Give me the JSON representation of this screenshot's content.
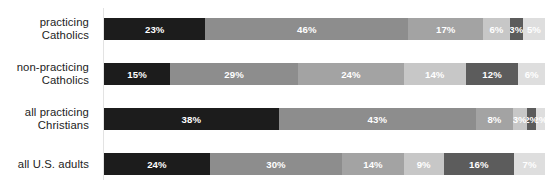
{
  "chart": {
    "type": "bar",
    "orientation": "horizontal-stacked",
    "background_color": "#ffffff",
    "axis_line_color": "#e3e3e3",
    "label_color": "#232323"
  },
  "chart_data": {
    "type": "bar",
    "title": "",
    "subtitle": "",
    "xlabel": "",
    "ylabel": "",
    "grid": false,
    "legend": null,
    "stacked": true,
    "orientation": "horizontal",
    "xlim": [
      0,
      100
    ],
    "categories": [
      "practicing\nCatholics",
      "non-practicing\nCatholics",
      "all practicing\nChristians",
      "all U.S. adults"
    ],
    "series": [
      {
        "name": "segment-1",
        "color": "#1c1c1c",
        "text_color": "#ffffff",
        "values": [
          23,
          15,
          38,
          24
        ]
      },
      {
        "name": "segment-2",
        "color": "#8d8d8d",
        "text_color": "#ffffff",
        "values": [
          46,
          29,
          43,
          30
        ]
      },
      {
        "name": "segment-3",
        "color": "#a3a3a3",
        "text_color": "#ffffff",
        "values": [
          17,
          24,
          8,
          14
        ]
      },
      {
        "name": "segment-4",
        "color": "#c7c7c7",
        "text_color": "#ffffff",
        "values": [
          6,
          14,
          3,
          9
        ]
      },
      {
        "name": "segment-5",
        "color": "#5c5c5c",
        "text_color": "#ffffff",
        "values": [
          3,
          12,
          2,
          16
        ]
      },
      {
        "name": "segment-6",
        "color": "#dedede",
        "text_color": "#ffffff",
        "values": [
          5,
          6,
          2,
          7
        ]
      }
    ]
  },
  "rows": [
    {
      "label": "practicing\nCatholics",
      "segments": [
        {
          "value": 23,
          "label": "23%",
          "color": "#1c1c1c",
          "text_color": "#ffffff"
        },
        {
          "value": 46,
          "label": "46%",
          "color": "#8d8d8d",
          "text_color": "#ffffff"
        },
        {
          "value": 17,
          "label": "17%",
          "color": "#a3a3a3",
          "text_color": "#ffffff"
        },
        {
          "value": 6,
          "label": "6%",
          "color": "#c7c7c7",
          "text_color": "#ffffff"
        },
        {
          "value": 3,
          "label": "3%",
          "color": "#5c5c5c",
          "text_color": "#ffffff"
        },
        {
          "value": 5,
          "label": "5%",
          "color": "#dedede",
          "text_color": "#ffffff"
        }
      ]
    },
    {
      "label": "non-practicing\nCatholics",
      "segments": [
        {
          "value": 15,
          "label": "15%",
          "color": "#1c1c1c",
          "text_color": "#ffffff"
        },
        {
          "value": 29,
          "label": "29%",
          "color": "#8d8d8d",
          "text_color": "#ffffff"
        },
        {
          "value": 24,
          "label": "24%",
          "color": "#a3a3a3",
          "text_color": "#ffffff"
        },
        {
          "value": 14,
          "label": "14%",
          "color": "#c7c7c7",
          "text_color": "#ffffff"
        },
        {
          "value": 12,
          "label": "12%",
          "color": "#5c5c5c",
          "text_color": "#ffffff"
        },
        {
          "value": 6,
          "label": "6%",
          "color": "#dedede",
          "text_color": "#ffffff"
        }
      ]
    },
    {
      "label": "all practicing\nChristians",
      "segments": [
        {
          "value": 38,
          "label": "38%",
          "color": "#1c1c1c",
          "text_color": "#ffffff"
        },
        {
          "value": 43,
          "label": "43%",
          "color": "#8d8d8d",
          "text_color": "#ffffff"
        },
        {
          "value": 8,
          "label": "8%",
          "color": "#a3a3a3",
          "text_color": "#ffffff"
        },
        {
          "value": 3,
          "label": "3%",
          "color": "#c7c7c7",
          "text_color": "#ffffff"
        },
        {
          "value": 2,
          "label": "2%",
          "color": "#5c5c5c",
          "text_color": "#ffffff"
        },
        {
          "value": 2,
          "label": "2%",
          "color": "#dedede",
          "text_color": "#ffffff"
        }
      ]
    },
    {
      "label": "all U.S. adults",
      "segments": [
        {
          "value": 24,
          "label": "24%",
          "color": "#1c1c1c",
          "text_color": "#ffffff"
        },
        {
          "value": 30,
          "label": "30%",
          "color": "#8d8d8d",
          "text_color": "#ffffff"
        },
        {
          "value": 14,
          "label": "14%",
          "color": "#a3a3a3",
          "text_color": "#ffffff"
        },
        {
          "value": 9,
          "label": "9%",
          "color": "#c7c7c7",
          "text_color": "#ffffff"
        },
        {
          "value": 16,
          "label": "16%",
          "color": "#5c5c5c",
          "text_color": "#ffffff"
        },
        {
          "value": 7,
          "label": "7%",
          "color": "#dedede",
          "text_color": "#ffffff"
        }
      ]
    }
  ]
}
